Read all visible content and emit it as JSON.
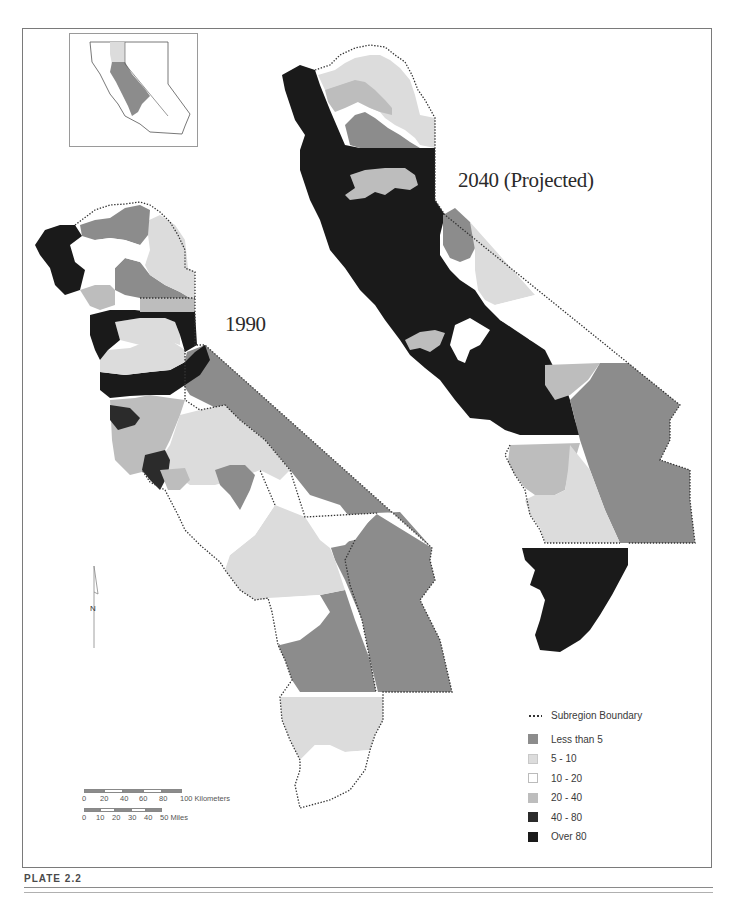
{
  "plate": {
    "title": "PLATE 2.2"
  },
  "colors": {
    "less_than_5": "#8c8c8c",
    "5_10": "#dcdcdc",
    "10_20": "#ffffff",
    "20_40": "#bdbdbd",
    "40_80": "#2b2b2b",
    "over_80": "#1a1a1a",
    "boundary": "#333333",
    "frame": "#7a7a7a"
  },
  "maps": {
    "map_1990": {
      "label": "1990"
    },
    "map_2040": {
      "label": "2040 (Projected)"
    }
  },
  "legend": {
    "boundary_label": "Subregion Boundary",
    "classes": [
      {
        "label": "Less than 5",
        "color": "#8c8c8c"
      },
      {
        "label": "5 - 10",
        "color": "#dcdcdc"
      },
      {
        "label": "10 - 20",
        "color": "#ffffff"
      },
      {
        "label": "20 - 40",
        "color": "#bdbdbd"
      },
      {
        "label": "40 - 80",
        "color": "#2b2b2b"
      },
      {
        "label": "Over 80",
        "color": "#1a1a1a"
      }
    ]
  },
  "scale": {
    "km_ticks": [
      "0",
      "20",
      "40",
      "60",
      "80",
      "100 Kilometers"
    ],
    "mile_ticks": [
      "0",
      "10",
      "20",
      "30",
      "40",
      "50 Miles"
    ]
  },
  "north_arrow": {
    "label": "N"
  },
  "inset": {
    "caption": "Study area within California"
  }
}
